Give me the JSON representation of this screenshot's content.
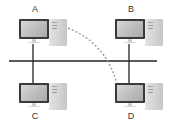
{
  "diagram": {
    "type": "bus-network-topology",
    "nodes": [
      {
        "id": "A",
        "label": "A",
        "position": "top-left"
      },
      {
        "id": "B",
        "label": "B",
        "position": "top-right"
      },
      {
        "id": "C",
        "label": "C",
        "position": "bottom-left"
      },
      {
        "id": "D",
        "label": "D",
        "position": "bottom-right"
      }
    ],
    "bus": {
      "label": "",
      "orientation": "horizontal"
    },
    "edges": [
      {
        "from": "A",
        "to": "bus",
        "style": "solid"
      },
      {
        "from": "B",
        "to": "bus",
        "style": "solid"
      },
      {
        "from": "C",
        "to": "bus",
        "style": "solid"
      },
      {
        "from": "D",
        "to": "bus",
        "style": "solid"
      },
      {
        "from": "A",
        "to": "D",
        "style": "dashed-curved-arrow"
      }
    ],
    "colors": {
      "line": "#222222",
      "dashed_arrow": "#9a9a9a",
      "monitor_bezel": "#3a3a3a",
      "tower": "#d2d2d2",
      "background": "#ffffff"
    }
  }
}
